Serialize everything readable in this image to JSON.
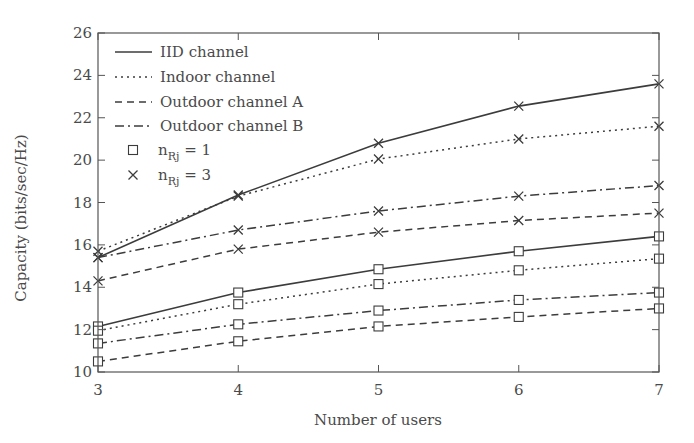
{
  "chart_data": {
    "type": "line",
    "title": "",
    "xlabel": "Number of users",
    "ylabel": "Capacity (bits/sec/Hz)",
    "x": [
      3,
      4,
      5,
      6,
      7
    ],
    "xlim": [
      3,
      7
    ],
    "ylim": [
      10,
      26
    ],
    "xticks": [
      3,
      4,
      5,
      6,
      7
    ],
    "yticks": [
      10,
      12,
      14,
      16,
      18,
      20,
      22,
      24,
      26
    ],
    "grid": false,
    "legend_position": "upper left",
    "legend": [
      {
        "label": "IID channel",
        "style": "solid"
      },
      {
        "label": "Indoor channel",
        "style": "dotted"
      },
      {
        "label": "Outdoor channel A",
        "style": "dashed"
      },
      {
        "label": "Outdoor channel B",
        "style": "dashdot"
      },
      {
        "label_main": "n",
        "label_sub": "Rj",
        "label_rest": " = 1",
        "marker": "square"
      },
      {
        "label_main": "n",
        "label_sub": "Rj",
        "label_rest": " = 3",
        "marker": "x"
      }
    ],
    "series": [
      {
        "name": "IID channel, nRj = 3",
        "style": "solid",
        "marker": "x",
        "values": [
          15.4,
          18.35,
          20.8,
          22.55,
          23.6
        ]
      },
      {
        "name": "Indoor channel, nRj = 3",
        "style": "dotted",
        "marker": "x",
        "values": [
          15.7,
          18.3,
          20.05,
          21.0,
          21.6
        ]
      },
      {
        "name": "Outdoor channel B, nRj = 3",
        "style": "dashdot",
        "marker": "x",
        "values": [
          15.4,
          16.7,
          17.6,
          18.3,
          18.8
        ]
      },
      {
        "name": "Outdoor channel A, nRj = 3",
        "style": "dashed",
        "marker": "x",
        "values": [
          14.3,
          15.8,
          16.6,
          17.15,
          17.5
        ]
      },
      {
        "name": "IID channel, nRj = 1",
        "style": "solid",
        "marker": "square",
        "values": [
          12.15,
          13.75,
          14.85,
          15.7,
          16.4
        ]
      },
      {
        "name": "Indoor channel, nRj = 1",
        "style": "dotted",
        "marker": "square",
        "values": [
          11.95,
          13.2,
          14.15,
          14.8,
          15.35
        ]
      },
      {
        "name": "Outdoor channel B, nRj = 1",
        "style": "dashdot",
        "marker": "square",
        "values": [
          11.35,
          12.25,
          12.9,
          13.4,
          13.75
        ]
      },
      {
        "name": "Outdoor channel A, nRj = 1",
        "style": "dashed",
        "marker": "square",
        "values": [
          10.5,
          11.45,
          12.15,
          12.6,
          13.0
        ]
      }
    ]
  },
  "colors": {
    "line": "#3c3c3c",
    "axis": "#555555",
    "text": "#4a4a4a",
    "background": "#ffffff"
  }
}
